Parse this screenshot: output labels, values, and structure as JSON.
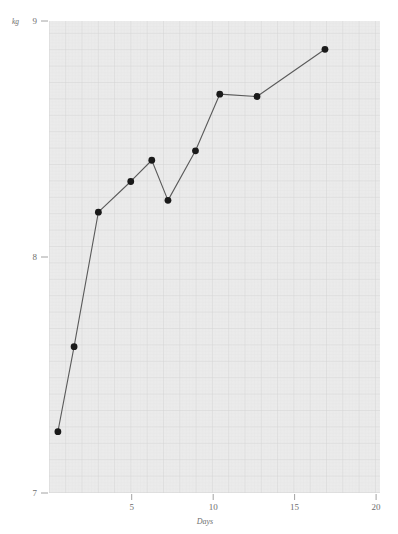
{
  "chart_data": {
    "type": "line",
    "title": "",
    "subtitle": "",
    "xlabel": "Days",
    "ylabel": "",
    "y_unit_label": "kg",
    "xlim": [
      0.45,
      20.9
    ],
    "ylim": [
      7,
      9
    ],
    "grid": true,
    "grid_style": "graph-paper",
    "legend": "none",
    "x": [
      1,
      2,
      3.5,
      5.5,
      6.8,
      7.8,
      9.5,
      11,
      13.3,
      17.5
    ],
    "values": [
      7.26,
      7.62,
      8.19,
      8.32,
      8.41,
      8.24,
      8.45,
      8.69,
      8.68,
      8.88
    ],
    "series": [
      {
        "name": "weight",
        "marker": "filled-circle",
        "marker_color": "#1a1a1a",
        "line_color": "#5a5a5a",
        "points": [
          {
            "x": 1,
            "y": 7.26
          },
          {
            "x": 2,
            "y": 7.62
          },
          {
            "x": 3.5,
            "y": 8.19
          },
          {
            "x": 5.5,
            "y": 8.32
          },
          {
            "x": 6.8,
            "y": 8.41
          },
          {
            "x": 7.8,
            "y": 8.24
          },
          {
            "x": 9.5,
            "y": 8.45
          },
          {
            "x": 11,
            "y": 8.69
          },
          {
            "x": 13.3,
            "y": 8.68
          },
          {
            "x": 17.5,
            "y": 8.88
          }
        ]
      }
    ],
    "x_ticks": [
      {
        "value": 5,
        "label": "5"
      },
      {
        "value": 10,
        "label": "10"
      },
      {
        "value": 15,
        "label": "15"
      },
      {
        "value": 20,
        "label": "20"
      }
    ],
    "y_ticks": [
      {
        "value": 7,
        "label": "7"
      },
      {
        "value": 8,
        "label": "8"
      },
      {
        "value": 9,
        "label": "9"
      }
    ],
    "colors": {
      "plot_background": "#ebebeb",
      "grid_minor": "#e1e1e1",
      "grid_major": "#d3d3d3",
      "line": "#5a5a5a",
      "marker": "#1a1a1a",
      "text": "#6e6e6e",
      "page_background": "#ffffff"
    }
  }
}
